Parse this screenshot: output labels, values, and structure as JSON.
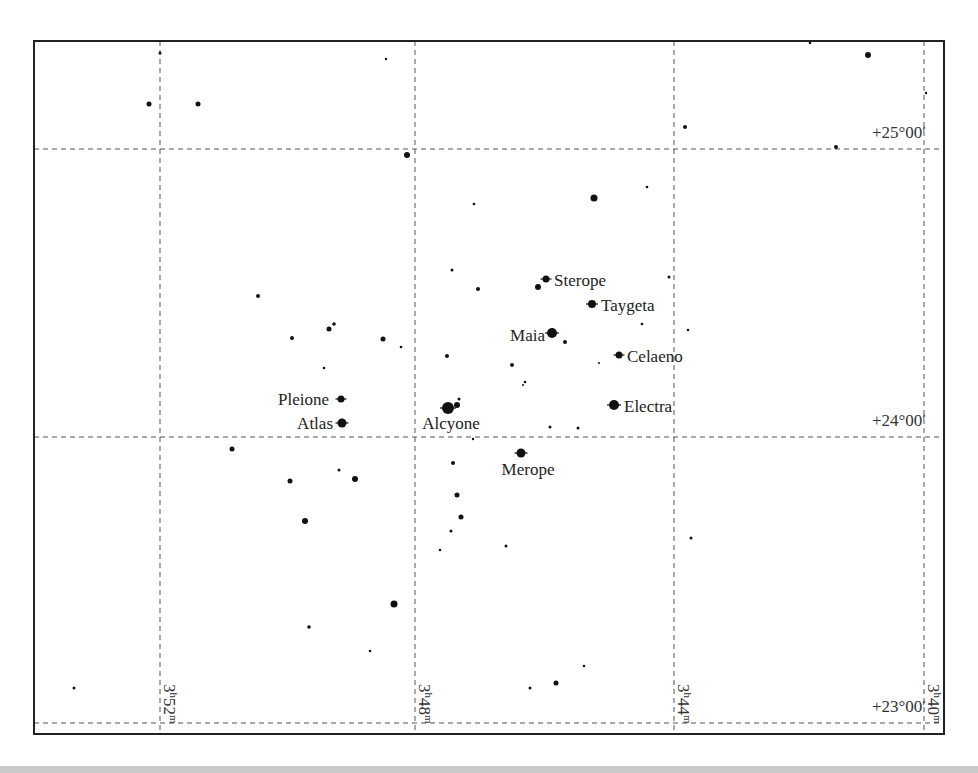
{
  "chart_data": {
    "type": "scatter",
    "title": "",
    "frame": {
      "x": 34,
      "y": 41,
      "width": 910,
      "height": 693
    },
    "grid": {
      "ra_lines": [
        {
          "x": 160,
          "label_main": "3",
          "label_h": "h",
          "label_min": "52",
          "label_m": "m"
        },
        {
          "x": 415,
          "label_main": "3",
          "label_h": "h",
          "label_min": "48",
          "label_m": "m"
        },
        {
          "x": 674,
          "label_main": "3",
          "label_h": "h",
          "label_min": "44",
          "label_m": "m"
        },
        {
          "x": 924,
          "label_main": "3",
          "label_h": "h",
          "label_min": "40",
          "label_m": "m"
        }
      ],
      "dec_lines": [
        {
          "y": 149,
          "label": "+25°00′"
        },
        {
          "y": 437,
          "label": "+24°00′"
        },
        {
          "y": 723,
          "label": "+23°00′"
        }
      ]
    },
    "named_stars": [
      {
        "name": "Sterope",
        "x": 546,
        "y": 279,
        "r": 3.5,
        "label_x": 554,
        "label_y": 286,
        "anchor": "start"
      },
      {
        "name": "Taygeta",
        "x": 592,
        "y": 304,
        "r": 4,
        "label_x": 601,
        "label_y": 311,
        "anchor": "start"
      },
      {
        "name": "Maia",
        "x": 552,
        "y": 333,
        "r": 5,
        "label_x": 545,
        "label_y": 341,
        "anchor": "end"
      },
      {
        "name": "Celaeno",
        "x": 619,
        "y": 355,
        "r": 3.5,
        "label_x": 627,
        "label_y": 362,
        "anchor": "start"
      },
      {
        "name": "Electra",
        "x": 614,
        "y": 405,
        "r": 5,
        "label_x": 624,
        "label_y": 412,
        "anchor": "start"
      },
      {
        "name": "Pleione",
        "x": 341,
        "y": 399,
        "r": 3.5,
        "label_x": 329,
        "label_y": 405,
        "anchor": "end"
      },
      {
        "name": "Atlas",
        "x": 342,
        "y": 423,
        "r": 4.5,
        "label_x": 333,
        "label_y": 429,
        "anchor": "end"
      },
      {
        "name": "Alcyone",
        "x": 448,
        "y": 408,
        "r": 6,
        "label_x": 451,
        "label_y": 429,
        "anchor": "middle"
      },
      {
        "name": "Merope",
        "x": 521,
        "y": 453,
        "r": 4.5,
        "label_x": 528,
        "label_y": 475,
        "anchor": "middle"
      }
    ],
    "stars": [
      {
        "x": 160,
        "y": 53,
        "r": 1.5
      },
      {
        "x": 149,
        "y": 104,
        "r": 2.5
      },
      {
        "x": 198,
        "y": 104,
        "r": 2.5
      },
      {
        "x": 386,
        "y": 59,
        "r": 1.2
      },
      {
        "x": 810,
        "y": 43,
        "r": 1.3
      },
      {
        "x": 868,
        "y": 55,
        "r": 3
      },
      {
        "x": 926,
        "y": 93,
        "r": 1.2
      },
      {
        "x": 685,
        "y": 127,
        "r": 2
      },
      {
        "x": 836,
        "y": 147,
        "r": 2
      },
      {
        "x": 407,
        "y": 155,
        "r": 3
      },
      {
        "x": 594,
        "y": 198,
        "r": 3.5
      },
      {
        "x": 647,
        "y": 187,
        "r": 1.3
      },
      {
        "x": 474,
        "y": 204,
        "r": 1.3
      },
      {
        "x": 452,
        "y": 270,
        "r": 1.5
      },
      {
        "x": 478,
        "y": 289,
        "r": 2
      },
      {
        "x": 669,
        "y": 277,
        "r": 1.5
      },
      {
        "x": 538,
        "y": 287,
        "r": 3
      },
      {
        "x": 258,
        "y": 296,
        "r": 2
      },
      {
        "x": 292,
        "y": 338,
        "r": 2
      },
      {
        "x": 329,
        "y": 329,
        "r": 2.5
      },
      {
        "x": 334,
        "y": 324,
        "r": 1.8
      },
      {
        "x": 383,
        "y": 339,
        "r": 2.5
      },
      {
        "x": 401,
        "y": 347,
        "r": 1.3
      },
      {
        "x": 324,
        "y": 368,
        "r": 1.3
      },
      {
        "x": 642,
        "y": 324,
        "r": 1.3
      },
      {
        "x": 688,
        "y": 330,
        "r": 1.3
      },
      {
        "x": 599,
        "y": 363,
        "r": 1
      },
      {
        "x": 565,
        "y": 342,
        "r": 2
      },
      {
        "x": 447,
        "y": 356,
        "r": 2
      },
      {
        "x": 512,
        "y": 365,
        "r": 2
      },
      {
        "x": 525,
        "y": 382,
        "r": 1.3
      },
      {
        "x": 523,
        "y": 385,
        "r": 1
      },
      {
        "x": 457,
        "y": 405,
        "r": 3
      },
      {
        "x": 459,
        "y": 399,
        "r": 1.5
      },
      {
        "x": 550,
        "y": 427,
        "r": 1.5
      },
      {
        "x": 578,
        "y": 428,
        "r": 1.5
      },
      {
        "x": 473,
        "y": 439,
        "r": 1.2
      },
      {
        "x": 232,
        "y": 449,
        "r": 2.5
      },
      {
        "x": 290,
        "y": 481,
        "r": 2.5
      },
      {
        "x": 339,
        "y": 470,
        "r": 1.5
      },
      {
        "x": 355,
        "y": 479,
        "r": 3
      },
      {
        "x": 305,
        "y": 521,
        "r": 3
      },
      {
        "x": 453,
        "y": 463,
        "r": 2
      },
      {
        "x": 457,
        "y": 495,
        "r": 2.5
      },
      {
        "x": 461,
        "y": 517,
        "r": 2.5
      },
      {
        "x": 451,
        "y": 531,
        "r": 1.5
      },
      {
        "x": 440,
        "y": 550,
        "r": 1.3
      },
      {
        "x": 506,
        "y": 546,
        "r": 1.5
      },
      {
        "x": 691,
        "y": 538,
        "r": 1.5
      },
      {
        "x": 394,
        "y": 604,
        "r": 3.5
      },
      {
        "x": 309,
        "y": 627,
        "r": 1.8
      },
      {
        "x": 370,
        "y": 651,
        "r": 1.3
      },
      {
        "x": 584,
        "y": 666,
        "r": 1.3
      },
      {
        "x": 556,
        "y": 683,
        "r": 2.5
      },
      {
        "x": 530,
        "y": 688,
        "r": 1.5
      },
      {
        "x": 74,
        "y": 688,
        "r": 1.5
      }
    ]
  }
}
